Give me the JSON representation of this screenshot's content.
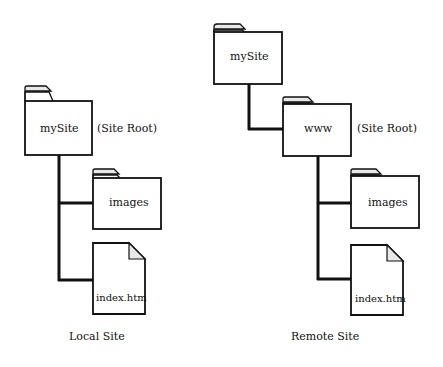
{
  "local_site": {
    "caption": "Local Site",
    "root_folder": {
      "name": "mySite",
      "annotation": "(Site Root)"
    },
    "children": [
      {
        "type": "folder",
        "name": "images"
      },
      {
        "type": "file",
        "name": "index.htm"
      }
    ]
  },
  "remote_site": {
    "caption": "Remote Site",
    "top_folder": {
      "name": "mySite"
    },
    "root_folder": {
      "name": "www",
      "annotation": "(Site Root)"
    },
    "children": [
      {
        "type": "folder",
        "name": "images"
      },
      {
        "type": "file",
        "name": "index.htm"
      }
    ]
  },
  "colors": {
    "line": "#111111",
    "tab": "#e8e8e8",
    "fill": "#ffffff"
  }
}
